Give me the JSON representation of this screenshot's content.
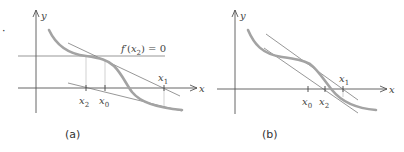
{
  "figure": {
    "panels": [
      {
        "id": "a",
        "caption": "(a)",
        "axis_x_label": "x",
        "axis_y_label": "y",
        "annotation": "f′(x₂) = 0",
        "annotation_parts": {
          "f": "f",
          "prime": "′",
          "open": "(",
          "var": "x",
          "sub": "2",
          "close": ") = 0"
        },
        "ticks": [
          {
            "name": "x2",
            "base": "x",
            "sub": "2"
          },
          {
            "name": "x0",
            "base": "x",
            "sub": "0"
          },
          {
            "name": "x1",
            "base": "x",
            "sub": "1"
          }
        ]
      },
      {
        "id": "b",
        "caption": "(b)",
        "axis_x_label": "x",
        "axis_y_label": "y",
        "ticks": [
          {
            "name": "x0",
            "base": "x",
            "sub": "0"
          },
          {
            "name": "x2",
            "base": "x",
            "sub": "2"
          },
          {
            "name": "x1",
            "base": "x",
            "sub": "1"
          }
        ]
      }
    ],
    "colors": {
      "curve": "#a3a3a3",
      "axis": "#555555",
      "tangent": "#6a6a6a",
      "guide": "#bdbdbd",
      "text": "#444444"
    }
  },
  "left_marker": "·"
}
